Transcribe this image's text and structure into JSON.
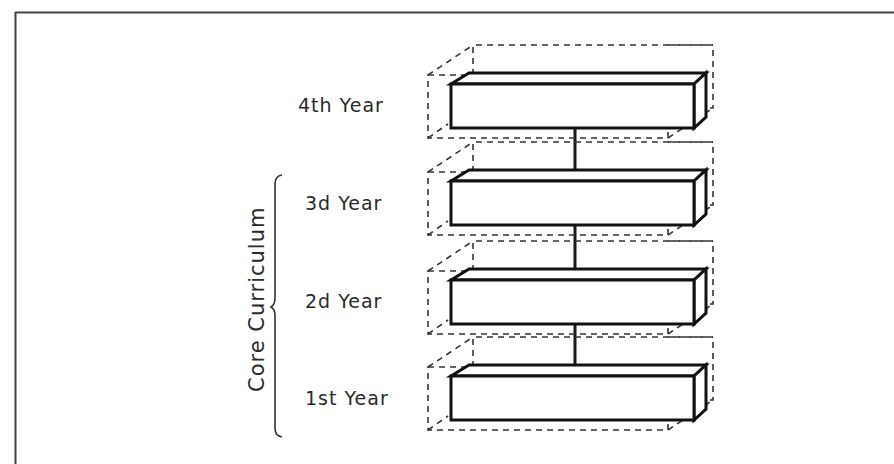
{
  "diagram": {
    "type": "stacked-3d-blocks",
    "group_label": "Core Curriculum",
    "group_covers": [
      "1st Year",
      "2d Year",
      "3d Year"
    ],
    "levels": [
      {
        "label": "4th Year",
        "order": 4
      },
      {
        "label": "3d Year",
        "order": 3
      },
      {
        "label": "2d Year",
        "order": 2
      },
      {
        "label": "1st Year",
        "order": 1
      }
    ],
    "connectors": [
      {
        "from": "1st Year",
        "to": "2d Year"
      },
      {
        "from": "2d Year",
        "to": "3d Year"
      },
      {
        "from": "3d Year",
        "to": "4th Year"
      }
    ],
    "colors": {
      "line": "#1a1a1a",
      "dashed": "#333333",
      "frame": "#444444",
      "background": "#ffffff"
    }
  }
}
